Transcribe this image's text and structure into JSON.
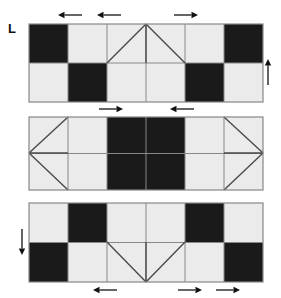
{
  "figure": {
    "label": "L",
    "label_x": 8,
    "label_y": 22,
    "background": "#ffffff",
    "dark_color": "#1a1a1a",
    "light_color": "#ebebeb",
    "line_color": "#888888",
    "diagonal_color": "#4a4a4a",
    "arrow_color": "#111111"
  },
  "grid": {
    "left": 29,
    "cell": 39,
    "columns": 6,
    "rows_per_panel": 2
  },
  "panels": [
    {
      "name": "panel-top",
      "index": 1,
      "x": 29,
      "y": 24,
      "width": 234,
      "height": 78,
      "cells": [
        [
          "dark",
          "light",
          "light",
          "light",
          "light",
          "dark"
        ],
        [
          "light",
          "dark",
          "light",
          "light",
          "dark",
          "light"
        ]
      ],
      "motif": {
        "type": "peak-triangle",
        "description": "inverted-V peak at top center spanning columns 3-4 of the upper row",
        "apex_x": 146,
        "apex_y": 24,
        "base_left_x": 107,
        "base_right_x": 185,
        "base_y": 63,
        "center_line": true
      }
    },
    {
      "name": "panel-middle",
      "index": 2,
      "x": 29,
      "y": 117,
      "width": 234,
      "height": 73,
      "cells": [
        [
          "light",
          "light",
          "dark",
          "dark",
          "light",
          "light"
        ],
        [
          "light",
          "light",
          "dark",
          "dark",
          "light",
          "light"
        ]
      ],
      "motif": {
        "type": "side-triangles",
        "description": "left-pointing triangle in leftmost column and right-pointing triangle in rightmost column, each with a horizontal mid line",
        "left_vertex_x": 29,
        "right_vertex_x": 263,
        "vertex_y": 153,
        "mid_line": true
      }
    },
    {
      "name": "panel-bottom",
      "index": 3,
      "x": 29,
      "y": 203,
      "width": 234,
      "height": 79,
      "cells": [
        [
          "light",
          "dark",
          "light",
          "light",
          "dark",
          "light"
        ],
        [
          "dark",
          "light",
          "light",
          "light",
          "light",
          "dark"
        ]
      ],
      "motif": {
        "type": "valley-triangle",
        "description": "V shape with vertex at bottom center spanning columns 3-4 of the lower row",
        "apex_x": 146,
        "apex_y": 282,
        "top_left_x": 107,
        "top_right_x": 185,
        "top_y": 242,
        "center_line": true
      }
    }
  ],
  "arrows": [
    {
      "name": "arrow-top-1",
      "direction": "left",
      "x": 70,
      "y": 15,
      "length": 24
    },
    {
      "name": "arrow-top-2",
      "direction": "left",
      "x": 109,
      "y": 15,
      "length": 24
    },
    {
      "name": "arrow-top-3",
      "direction": "right",
      "x": 186,
      "y": 15,
      "length": 24
    },
    {
      "name": "arrow-right-up",
      "direction": "up",
      "x": 268,
      "y": 72,
      "length": 26
    },
    {
      "name": "arrow-mid-1",
      "direction": "right",
      "x": 111,
      "y": 109,
      "length": 24
    },
    {
      "name": "arrow-mid-2",
      "direction": "left",
      "x": 182,
      "y": 109,
      "length": 24
    },
    {
      "name": "arrow-left-down",
      "direction": "down",
      "x": 22,
      "y": 242,
      "length": 26
    },
    {
      "name": "arrow-bottom-1",
      "direction": "left",
      "x": 105,
      "y": 290,
      "length": 24
    },
    {
      "name": "arrow-bottom-2",
      "direction": "right",
      "x": 190,
      "y": 290,
      "length": 24
    },
    {
      "name": "arrow-bottom-3",
      "direction": "right",
      "x": 228,
      "y": 290,
      "length": 24
    }
  ]
}
